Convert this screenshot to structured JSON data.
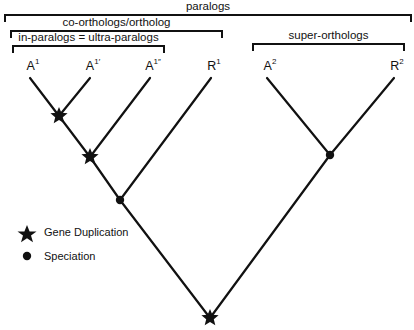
{
  "diagram": {
    "type": "phylogenetic-tree",
    "colors": {
      "line": "#111111",
      "background": "#ffffff"
    },
    "brackets": [
      {
        "id": "paralogs",
        "label": "paralogs",
        "x1": 5,
        "x2": 411,
        "y": 15
      },
      {
        "id": "co-orthologs",
        "label": "co-orthologs/ortholog",
        "x1": 11,
        "x2": 222,
        "y": 31
      },
      {
        "id": "in-paralogs",
        "label": "in-paralogs = ultra-paralogs",
        "x1": 13,
        "x2": 164,
        "y": 46
      },
      {
        "id": "super-orthologs",
        "label": "super-orthologs",
        "x1": 253,
        "x2": 404,
        "y": 44
      }
    ],
    "leaves": [
      {
        "id": "A1",
        "base": "A",
        "sup": "1",
        "x": 30
      },
      {
        "id": "A1p",
        "base": "A",
        "sup": "1′",
        "x": 90
      },
      {
        "id": "A1pp",
        "base": "A",
        "sup": "1″",
        "x": 150
      },
      {
        "id": "R1",
        "base": "R",
        "sup": "1",
        "x": 211
      },
      {
        "id": "A2",
        "base": "A",
        "sup": "2",
        "x": 267
      },
      {
        "id": "R2",
        "base": "R",
        "sup": "2",
        "x": 394
      }
    ],
    "nodes": [
      {
        "id": "dup1",
        "type": "gene-duplication",
        "x": 59,
        "y": 116
      },
      {
        "id": "dup2",
        "type": "gene-duplication",
        "x": 90,
        "y": 157
      },
      {
        "id": "spec1",
        "type": "speciation",
        "x": 120,
        "y": 200
      },
      {
        "id": "spec2",
        "type": "speciation",
        "x": 330,
        "y": 155
      },
      {
        "id": "root",
        "type": "gene-duplication",
        "x": 210,
        "y": 318
      }
    ],
    "legend": {
      "items": [
        {
          "symbol": "star-icon",
          "label": "Gene Duplication"
        },
        {
          "symbol": "dot-icon",
          "label": "Speciation"
        }
      ]
    }
  }
}
